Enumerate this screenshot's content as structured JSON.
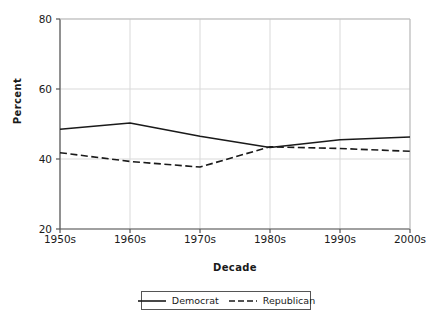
{
  "chart_data": {
    "type": "line",
    "title": "",
    "subtitle": "",
    "xlabel": "Decade",
    "ylabel": "Percent",
    "categories": [
      "1950s",
      "1960s",
      "1970s",
      "1980s",
      "1990s",
      "2000s"
    ],
    "series": [
      {
        "name": "Democrat",
        "style": "solid",
        "color": "#1a1a1a",
        "values": [
          48.5,
          50.3,
          46.5,
          43.3,
          45.5,
          46.3
        ]
      },
      {
        "name": "Republican",
        "style": "dashed",
        "color": "#1a1a1a",
        "values": [
          41.8,
          39.3,
          37.7,
          43.5,
          43.0,
          42.2
        ]
      }
    ],
    "yticks": [
      20,
      40,
      60,
      80
    ],
    "ytick_labels": [
      "20",
      "40",
      "60",
      "80"
    ],
    "ylim": [
      20,
      80
    ],
    "xlim": [
      "1950s",
      "2000s"
    ],
    "grid": "horizontal-and-vertical",
    "grid_color": "#d9d9d9",
    "legend_position": "bottom-center",
    "legend_entries": [
      "Democrat",
      "Republican"
    ],
    "annotations": [],
    "background": "#ffffff",
    "axis_color": "#555555"
  }
}
